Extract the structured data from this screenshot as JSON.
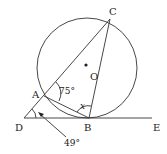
{
  "diagram": {
    "type": "geometry-circle-tangent",
    "points": {
      "A": {
        "label": "A"
      },
      "B": {
        "label": "B"
      },
      "C": {
        "label": "C"
      },
      "D": {
        "label": "D"
      },
      "E": {
        "label": "E"
      },
      "O": {
        "label": "O"
      }
    },
    "angles": {
      "angle_CAB": "75°",
      "angle_ADB": "49°",
      "angle_x": "x"
    },
    "colors": {
      "stroke": "#333333",
      "text": "#222222",
      "background": "#ffffff"
    }
  }
}
